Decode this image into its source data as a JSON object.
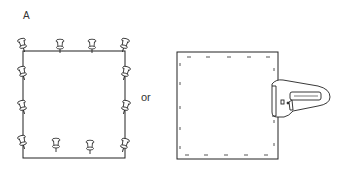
{
  "figure": {
    "label": "A",
    "connector": "or",
    "panels": [
      {
        "name": "pinned-frame",
        "fastener": "push-pins",
        "pin_count": 12
      },
      {
        "name": "stapled-frame",
        "fastener": "staples",
        "tool": "staple-gun"
      }
    ]
  },
  "colors": {
    "line": "#222222",
    "background": "#ffffff"
  }
}
